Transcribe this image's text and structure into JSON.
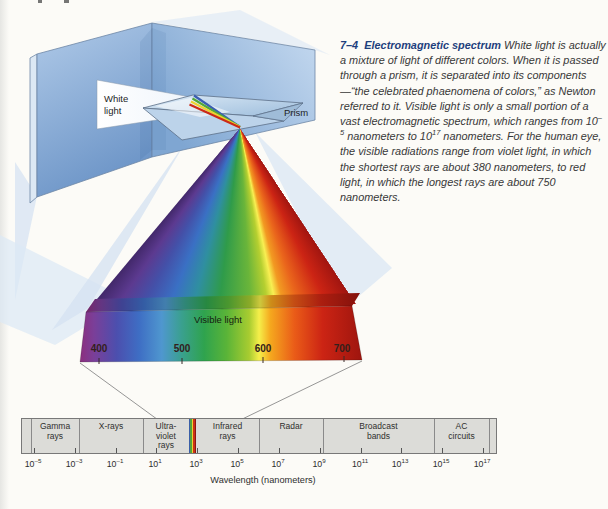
{
  "figure": {
    "caption": {
      "number": "7–4",
      "title": "Electromagnetic spectrum",
      "body_1": " White light is actually a mixture of light of different colors. When it is passed through a prism, it is separated into its components—“the celebrated phaenomena of colors,” as Newton referred to it. Visible light is only a small portion of a vast electromagnetic spectrum, which ranges from 10",
      "sup_1": "–5",
      "body_2": " nanometers to 10",
      "sup_2": "17",
      "body_3": " nanometers. For the human eye, the visible radiations range from violet light, in which the shortest rays are about 380 nanometers, to red light, in which the longest rays are about 750 nanometers."
    },
    "prism_diagram": {
      "white_light_label": "White light",
      "prism_label": "Prism"
    },
    "visible_band": {
      "label": "Visible light",
      "tick_labels": [
        "400",
        "500",
        "600",
        "700"
      ]
    },
    "em_bar": {
      "segments": [
        {
          "lines": [
            "Gamma",
            "rays"
          ]
        },
        {
          "lines": [
            "X-rays"
          ]
        },
        {
          "lines": [
            "Ultra-",
            "violet",
            "rays"
          ]
        },
        {
          "lines": [
            "Infrared",
            "rays"
          ]
        },
        {
          "lines": [
            "Radar"
          ]
        },
        {
          "lines": [
            "Broadcast",
            "bands"
          ]
        },
        {
          "lines": [
            "AC",
            "circuits"
          ]
        }
      ],
      "axis_ticks": [
        {
          "base": "10",
          "exp": "–5"
        },
        {
          "base": "10",
          "exp": "–3"
        },
        {
          "base": "10",
          "exp": "–1"
        },
        {
          "base": "10",
          "exp": "1"
        },
        {
          "base": "10",
          "exp": "3"
        },
        {
          "base": "10",
          "exp": "5"
        },
        {
          "base": "10",
          "exp": "7"
        },
        {
          "base": "10",
          "exp": "9"
        },
        {
          "base": "10",
          "exp": "11"
        },
        {
          "base": "10",
          "exp": "13"
        },
        {
          "base": "10",
          "exp": "15"
        },
        {
          "base": "10",
          "exp": "17"
        }
      ],
      "axis_label": "Wavelength (nanometers)"
    },
    "colors": {
      "caption_heading": "#1e3f7d",
      "wall_blue": "#7ba3d2",
      "bar_fill": "#dcdcd8",
      "spectrum_violet": "#7a3f99",
      "spectrum_blue": "#3e6ec4",
      "spectrum_green": "#2fa34e",
      "spectrum_yellow": "#f5ef4a",
      "spectrum_red": "#c62213",
      "strip_stripes": [
        "#3b5fa8",
        "#55a23c",
        "#ecd32f",
        "#cc3318",
        "#8c1710"
      ]
    }
  }
}
